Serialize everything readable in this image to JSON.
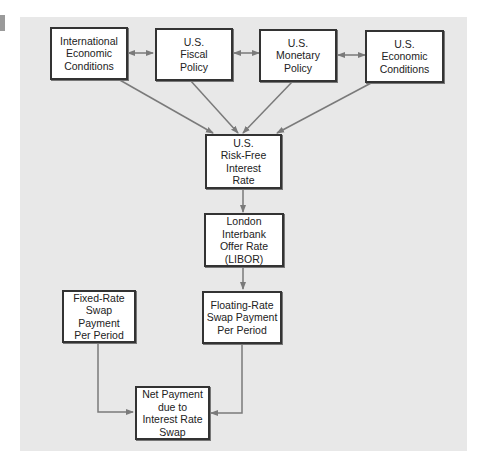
{
  "diagram": {
    "nodes": [
      {
        "id": "intl",
        "label": "International\nEconomic\nConditions"
      },
      {
        "id": "fiscal",
        "label": "U.S.\nFiscal\nPolicy"
      },
      {
        "id": "monetary",
        "label": "U.S.\nMonetary\nPolicy"
      },
      {
        "id": "econ",
        "label": "U.S.\nEconomic\nConditions"
      },
      {
        "id": "riskfree",
        "label": "U.S.\nRisk-Free\nInterest\nRate"
      },
      {
        "id": "libor",
        "label": "London Interbank\nOffer Rate\n(LIBOR)"
      },
      {
        "id": "fixed",
        "label": "Fixed-Rate\nSwap\nPayment\nPer Period"
      },
      {
        "id": "floating",
        "label": "Floating-Rate\nSwap Payment\nPer Period"
      },
      {
        "id": "net",
        "label": "Net Payment\ndue to\nInterest Rate\nSwap"
      }
    ],
    "edges": [
      {
        "from": "intl",
        "to": "fiscal",
        "type": "bidirectional"
      },
      {
        "from": "fiscal",
        "to": "monetary",
        "type": "bidirectional"
      },
      {
        "from": "monetary",
        "to": "econ",
        "type": "bidirectional"
      },
      {
        "from": "intl",
        "to": "riskfree"
      },
      {
        "from": "fiscal",
        "to": "riskfree"
      },
      {
        "from": "monetary",
        "to": "riskfree"
      },
      {
        "from": "econ",
        "to": "riskfree"
      },
      {
        "from": "riskfree",
        "to": "libor"
      },
      {
        "from": "libor",
        "to": "floating"
      },
      {
        "from": "fixed",
        "to": "net"
      },
      {
        "from": "floating",
        "to": "net"
      }
    ],
    "colors": {
      "background": "#e8e8e8",
      "box": "#ffffff",
      "border": "#333333",
      "arrow": "#7a7a7a"
    }
  }
}
